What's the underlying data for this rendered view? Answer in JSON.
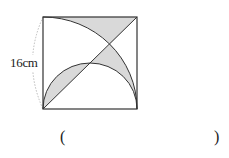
{
  "figure": {
    "dimension_label": "16cm",
    "shape": "square with quarter-circle arc from bottom-right corner through top-left, semicircle on bottom side, diagonal from bottom-left to top-right; shaded regions between curves and diagonal",
    "colors": {
      "stroke": "#333333",
      "shade": "#d9d9d9",
      "dim_arc": "#aaaaaa"
    }
  },
  "answer": {
    "open_paren": "(",
    "close_paren": ")",
    "value": ""
  }
}
